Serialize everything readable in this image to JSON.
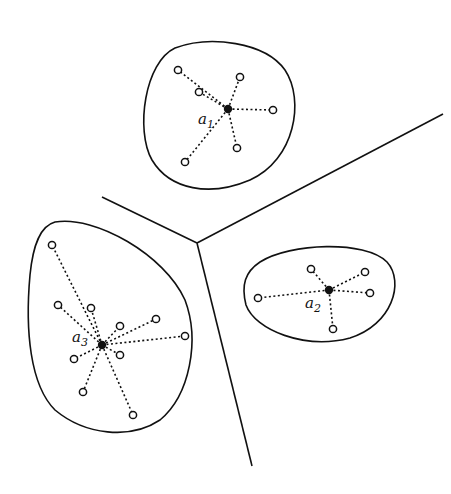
{
  "diagram": {
    "colors": {
      "line": "#111111",
      "background": "#ffffff"
    },
    "boundaries": [
      {
        "from": [
          197,
          243
        ],
        "to": [
          102,
          197
        ]
      },
      {
        "from": [
          197,
          243
        ],
        "to": [
          443,
          114
        ]
      },
      {
        "from": [
          197,
          243
        ],
        "to": [
          252,
          466
        ]
      }
    ],
    "clusters": [
      {
        "label": "a",
        "subscript": "1",
        "center": [
          228,
          109
        ],
        "label_pos": [
          198,
          124
        ],
        "outline": "M175,48 C210,35 265,42 285,70 C305,100 295,160 250,180 C210,197 170,190 152,160 C135,130 145,62 175,48 Z",
        "points": [
          [
            178,
            70
          ],
          [
            199,
            92
          ],
          [
            240,
            77
          ],
          [
            273,
            110
          ],
          [
            237,
            148
          ],
          [
            185,
            162
          ]
        ]
      },
      {
        "label": "a",
        "subscript": "2",
        "center": [
          329,
          290
        ],
        "label_pos": [
          305,
          308
        ],
        "outline": "M260,262 C290,243 365,240 387,262 C405,282 392,325 350,338 C305,350 255,330 246,305 C241,285 245,272 260,262 Z",
        "points": [
          [
            311,
            269
          ],
          [
            365,
            272
          ],
          [
            370,
            293
          ],
          [
            258,
            298
          ],
          [
            333,
            329
          ]
        ]
      },
      {
        "label": "a",
        "subscript": "3",
        "center": [
          102,
          345
        ],
        "label_pos": [
          72,
          342
        ],
        "outline": "M55,222 C95,215 165,255 185,300 C200,340 190,395 160,420 C130,440 85,435 55,410 C30,385 25,330 30,275 C33,245 40,226 55,222 Z",
        "points": [
          [
            52,
            245
          ],
          [
            58,
            305
          ],
          [
            91,
            308
          ],
          [
            120,
            326
          ],
          [
            156,
            319
          ],
          [
            185,
            336
          ],
          [
            120,
            355
          ],
          [
            74,
            359
          ],
          [
            83,
            392
          ],
          [
            133,
            415
          ]
        ]
      }
    ]
  }
}
